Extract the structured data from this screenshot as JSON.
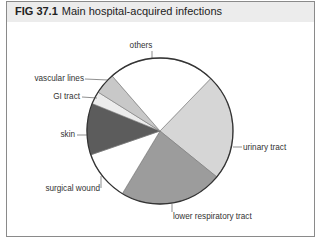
{
  "figure": {
    "number": "FIG 37.1",
    "title": "Main hospital-acquired infections"
  },
  "chart_data": {
    "type": "pie",
    "title": "Main hospital-acquired infections",
    "start_angle_deg": 44,
    "direction": "clockwise",
    "slices": [
      {
        "label": "urinary tract",
        "value": 23.6,
        "color": "#d6d6d6"
      },
      {
        "label": "lower respiratory tract",
        "value": 22.8,
        "color": "#9c9c9c"
      },
      {
        "label": "surgical wound",
        "value": 11.1,
        "color": "#ffffff"
      },
      {
        "label": "skin",
        "value": 11.4,
        "color": "#5c5c5c"
      },
      {
        "label": "GI tract",
        "value": 2.8,
        "color": "#ececec"
      },
      {
        "label": "vascular lines",
        "value": 4.7,
        "color": "#c8c8c8"
      },
      {
        "label": "others",
        "value": 23.6,
        "color": "#ffffff"
      }
    ],
    "labels": [
      "others",
      "vascular lines",
      "GI tract",
      "skin",
      "surgical wound",
      "lower respiratory tract",
      "urinary tract"
    ]
  }
}
